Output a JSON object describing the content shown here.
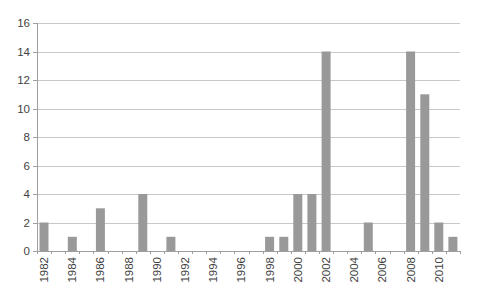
{
  "window": {
    "background": "#ffffff"
  },
  "chart_data": {
    "type": "bar",
    "title": "",
    "subtitle": "",
    "xlabel": "",
    "ylabel": "",
    "categories": [
      "1982",
      "1983",
      "1984",
      "1985",
      "1986",
      "1987",
      "1988",
      "1989",
      "1990",
      "1991",
      "1992",
      "1993",
      "1994",
      "1995",
      "1996",
      "1997",
      "1998",
      "1999",
      "2000",
      "2001",
      "2002",
      "2003",
      "2004",
      "2005",
      "2006",
      "2007",
      "2008",
      "2009",
      "2010",
      "2011"
    ],
    "values": [
      2,
      0,
      1,
      0,
      3,
      0,
      0,
      4,
      0,
      1,
      0,
      0,
      0,
      0,
      0,
      0,
      1,
      1,
      4,
      4,
      14,
      0,
      0,
      2,
      0,
      0,
      14,
      11,
      2,
      1
    ],
    "ylim": [
      0,
      16
    ],
    "ytick_step": 2,
    "y_tick_labels": [
      "0",
      "2",
      "4",
      "6",
      "8",
      "10",
      "12",
      "14",
      "16"
    ],
    "x_tick_labels": [
      "1982",
      "1984",
      "1986",
      "1988",
      "1990",
      "1992",
      "1994",
      "1996",
      "1998",
      "2000",
      "2002",
      "2004",
      "2006",
      "2008",
      "2010"
    ],
    "x_label_rotation_deg": -90,
    "grid": true,
    "legend": "none",
    "colors": {
      "bar": "#999999",
      "gridline": "#c8c8c8",
      "axis": "#9f9f9f",
      "tick_text": "#3f3f3f",
      "background": "#ffffff"
    }
  }
}
